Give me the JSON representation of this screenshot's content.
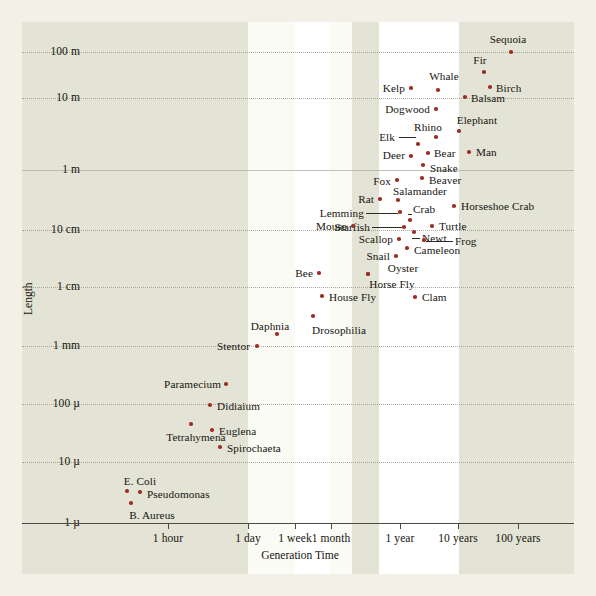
{
  "figure": {
    "axis_title_x": "Generation Time",
    "axis_title_y": "Length",
    "point_color": "#9e2f27",
    "panel_color": "#e3e3d6",
    "page_color": "#f3f1e7"
  },
  "chart_data": {
    "type": "scatter",
    "title": "",
    "xlabel": "Generation Time",
    "ylabel": "Length",
    "xscale": "log",
    "yscale": "log",
    "grid": true,
    "legend": "none",
    "xticks": [
      {
        "label": "1 hour",
        "px": 168
      },
      {
        "label": "1 day",
        "px": 248
      },
      {
        "label": "1 week",
        "px": 295
      },
      {
        "label": "1 month",
        "px": 331
      },
      {
        "label": "1 year",
        "px": 400
      },
      {
        "label": "10 years",
        "px": 458
      },
      {
        "label": "100 years",
        "px": 518
      }
    ],
    "yticks": [
      {
        "label": "100 m",
        "px": 52
      },
      {
        "label": "10 m",
        "px": 98
      },
      {
        "label": "1 m",
        "px": 170
      },
      {
        "label": "10 cm",
        "px": 230
      },
      {
        "label": "1 cm",
        "px": 287
      },
      {
        "label": "1 mm",
        "px": 346
      },
      {
        "label": "100 µ",
        "px": 404
      },
      {
        "label": "10 µ",
        "px": 462
      },
      {
        "label": "1 µ",
        "px": 523
      }
    ],
    "points": [
      {
        "name": "Sequoia",
        "x": 511,
        "y": 52,
        "lx": 508,
        "ly": 39,
        "side": "c"
      },
      {
        "name": "Fir",
        "x": 484,
        "y": 72,
        "lx": 480,
        "ly": 60,
        "side": "c"
      },
      {
        "name": "Whale",
        "x": 438,
        "y": 90,
        "lx": 444,
        "ly": 76,
        "side": "c"
      },
      {
        "name": "Kelp",
        "x": 411,
        "y": 88,
        "lx": 405,
        "ly": 88,
        "side": "r"
      },
      {
        "name": "Birch",
        "x": 490,
        "y": 87,
        "lx": 496,
        "ly": 88,
        "side": "l"
      },
      {
        "name": "Balsam",
        "x": 465,
        "y": 97,
        "lx": 471,
        "ly": 98,
        "side": "l"
      },
      {
        "name": "Dogwood",
        "x": 436,
        "y": 109,
        "lx": 430,
        "ly": 109,
        "side": "r"
      },
      {
        "name": "Elephant",
        "x": 459,
        "y": 131,
        "lx": 477,
        "ly": 120,
        "side": "c"
      },
      {
        "name": "Rhino",
        "x": 436,
        "y": 137,
        "lx": 428,
        "ly": 127,
        "side": "c"
      },
      {
        "name": "Elk",
        "x": 418,
        "y": 144,
        "lx": 395,
        "ly": 137,
        "side": "r",
        "leader": {
          "x1": 399,
          "x2": 416,
          "y": 137
        }
      },
      {
        "name": "Deer",
        "x": 411,
        "y": 156,
        "lx": 405,
        "ly": 155,
        "side": "r"
      },
      {
        "name": "Bear",
        "x": 428,
        "y": 153,
        "lx": 434,
        "ly": 153,
        "side": "l"
      },
      {
        "name": "Man",
        "x": 469,
        "y": 152,
        "lx": 476,
        "ly": 152,
        "side": "l"
      },
      {
        "name": "Snake",
        "x": 423,
        "y": 165,
        "lx": 430,
        "ly": 168,
        "side": "l"
      },
      {
        "name": "Beaver",
        "x": 422,
        "y": 178,
        "lx": 429,
        "ly": 180,
        "side": "l"
      },
      {
        "name": "Fox",
        "x": 397,
        "y": 180,
        "lx": 391,
        "ly": 181,
        "side": "r"
      },
      {
        "name": "Salamander",
        "x": 398,
        "y": 200,
        "lx": 393,
        "ly": 191,
        "side": "l"
      },
      {
        "name": "Rat",
        "x": 380,
        "y": 199,
        "lx": 374,
        "ly": 199,
        "side": "r"
      },
      {
        "name": "Horseshoe Crab",
        "x": 454,
        "y": 206,
        "lx": 461,
        "ly": 206,
        "side": "l"
      },
      {
        "name": "Crab",
        "x": 410,
        "y": 220,
        "lx": 413,
        "ly": 209,
        "side": "l",
        "leader": {
          "x1": 408,
          "x2": 412,
          "y": 214,
          "diag": true
        }
      },
      {
        "name": "Lemming",
        "x": 400,
        "y": 212,
        "lx": 364,
        "ly": 213,
        "side": "r",
        "leader": {
          "x1": 366,
          "x2": 398,
          "y": 213
        }
      },
      {
        "name": "Turtle",
        "x": 432,
        "y": 226,
        "lx": 439,
        "ly": 226,
        "side": "l"
      },
      {
        "name": "Starfish",
        "x": 404,
        "y": 227,
        "lx": 370,
        "ly": 227,
        "side": "r",
        "leader": {
          "x1": 372,
          "x2": 402,
          "y": 227
        }
      },
      {
        "name": "Mouse",
        "x": 353,
        "y": 226,
        "lx": 347,
        "ly": 226,
        "side": "r"
      },
      {
        "name": "Newt",
        "x": 414,
        "y": 232,
        "lx": 422,
        "ly": 238,
        "side": "l",
        "leader": {
          "x1": 412,
          "x2": 420,
          "y": 238
        }
      },
      {
        "name": "Frog",
        "x": 424,
        "y": 240,
        "lx": 455,
        "ly": 241,
        "side": "l",
        "leader": {
          "x1": 426,
          "x2": 453,
          "y": 241
        }
      },
      {
        "name": "Scallop",
        "x": 399,
        "y": 239,
        "lx": 393,
        "ly": 239,
        "side": "r"
      },
      {
        "name": "Cameleon",
        "x": 407,
        "y": 248,
        "lx": 414,
        "ly": 250,
        "side": "l"
      },
      {
        "name": "Snail",
        "x": 396,
        "y": 256,
        "lx": 390,
        "ly": 256,
        "side": "r"
      },
      {
        "name": "Oyster",
        "x": 368,
        "y": 274,
        "lx": 403,
        "ly": 268,
        "side": "c"
      },
      {
        "name": "Bee",
        "x": 319,
        "y": 273,
        "lx": 313,
        "ly": 273,
        "side": "r"
      },
      {
        "name": "Horse Fly",
        "x": 368,
        "y": 274,
        "lx": 392,
        "ly": 284,
        "side": "c"
      },
      {
        "name": "House Fly",
        "x": 322,
        "y": 296,
        "lx": 329,
        "ly": 297,
        "side": "l"
      },
      {
        "name": "Clam",
        "x": 415,
        "y": 297,
        "lx": 422,
        "ly": 297,
        "side": "l"
      },
      {
        "name": "Drosophilia",
        "x": 313,
        "y": 316,
        "lx": 339,
        "ly": 330,
        "side": "c"
      },
      {
        "name": "Daphnia",
        "x": 277,
        "y": 334,
        "lx": 270,
        "ly": 326,
        "side": "c"
      },
      {
        "name": "Stentor",
        "x": 257,
        "y": 346,
        "lx": 250,
        "ly": 346,
        "side": "r"
      },
      {
        "name": "Paramecium",
        "x": 226,
        "y": 384,
        "lx": 221,
        "ly": 384,
        "side": "r"
      },
      {
        "name": "Didiaium",
        "x": 210,
        "y": 405,
        "lx": 217,
        "ly": 406,
        "side": "l"
      },
      {
        "name": "Tetrahymena",
        "x": 191,
        "y": 424,
        "lx": 196,
        "ly": 437,
        "side": "c"
      },
      {
        "name": "Euglena",
        "x": 212,
        "y": 430,
        "lx": 219,
        "ly": 431,
        "side": "l"
      },
      {
        "name": "Spirochaeta",
        "x": 220,
        "y": 447,
        "lx": 227,
        "ly": 448,
        "side": "l"
      },
      {
        "name": "E. Coli",
        "x": 127,
        "y": 491,
        "lx": 140,
        "ly": 481,
        "side": "c"
      },
      {
        "name": "Pseudomonas",
        "x": 140,
        "y": 492,
        "lx": 147,
        "ly": 494,
        "side": "l"
      },
      {
        "name": "B. Aureus",
        "x": 131,
        "y": 503,
        "lx": 152,
        "ly": 515,
        "side": "c"
      }
    ]
  }
}
